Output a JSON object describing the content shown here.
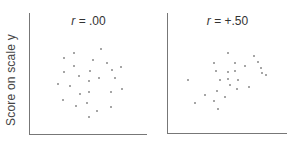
{
  "chart_data": [
    {
      "type": "scatter",
      "title": "r = .00",
      "title_parts": {
        "symbol": "r",
        "rest": " = .00"
      },
      "xlabel": "",
      "ylabel": "Score on scale y",
      "grid": false,
      "xlim": [
        0,
        10
      ],
      "ylim": [
        0,
        10
      ],
      "points": [
        [
          2.9,
          6.3
        ],
        [
          3.8,
          6.7
        ],
        [
          6.1,
          7.0
        ],
        [
          5.4,
          6.1
        ],
        [
          6.6,
          5.9
        ],
        [
          7.8,
          5.5
        ],
        [
          2.9,
          5.1
        ],
        [
          3.8,
          5.6
        ],
        [
          4.2,
          4.8
        ],
        [
          5.1,
          5.2
        ],
        [
          7.0,
          5.3
        ],
        [
          7.3,
          4.6
        ],
        [
          2.4,
          4.1
        ],
        [
          3.4,
          4.0
        ],
        [
          5.0,
          4.4
        ],
        [
          5.9,
          4.6
        ],
        [
          4.3,
          3.3
        ],
        [
          5.0,
          3.5
        ],
        [
          6.9,
          3.5
        ],
        [
          7.9,
          3.7
        ],
        [
          2.8,
          2.8
        ],
        [
          3.9,
          2.3
        ],
        [
          4.9,
          2.6
        ],
        [
          5.7,
          1.9
        ],
        [
          6.9,
          2.2
        ],
        [
          5.0,
          1.4
        ]
      ]
    },
    {
      "type": "scatter",
      "title": "r = +.50",
      "title_parts": {
        "symbol": "r",
        "rest": " = +.50"
      },
      "xlabel": "",
      "ylabel": "",
      "grid": false,
      "xlim": [
        0,
        10
      ],
      "ylim": [
        0,
        10
      ],
      "points": [
        [
          5.0,
          6.7
        ],
        [
          7.2,
          6.4
        ],
        [
          5.6,
          5.8
        ],
        [
          7.6,
          5.9
        ],
        [
          3.9,
          5.8
        ],
        [
          7.8,
          5.4
        ],
        [
          6.5,
          5.6
        ],
        [
          7.9,
          5.0
        ],
        [
          8.2,
          4.8
        ],
        [
          4.0,
          5.2
        ],
        [
          5.0,
          5.1
        ],
        [
          5.6,
          5.2
        ],
        [
          1.7,
          4.4
        ],
        [
          4.4,
          4.4
        ],
        [
          5.0,
          4.5
        ],
        [
          5.9,
          4.4
        ],
        [
          5.2,
          4.0
        ],
        [
          4.1,
          3.5
        ],
        [
          5.8,
          3.7
        ],
        [
          6.8,
          3.8
        ],
        [
          3.1,
          3.2
        ],
        [
          3.9,
          2.7
        ],
        [
          4.8,
          3.0
        ],
        [
          2.3,
          2.5
        ],
        [
          4.2,
          2.0
        ]
      ]
    }
  ],
  "labels": {
    "y_axis": "Score on scale y",
    "left_title_symbol": "r",
    "left_title_rest": " = .00",
    "right_title_symbol": "r",
    "right_title_rest": " = +.50"
  },
  "colors": {
    "axis": "#777777",
    "point": "#888888",
    "text": "#333333"
  }
}
